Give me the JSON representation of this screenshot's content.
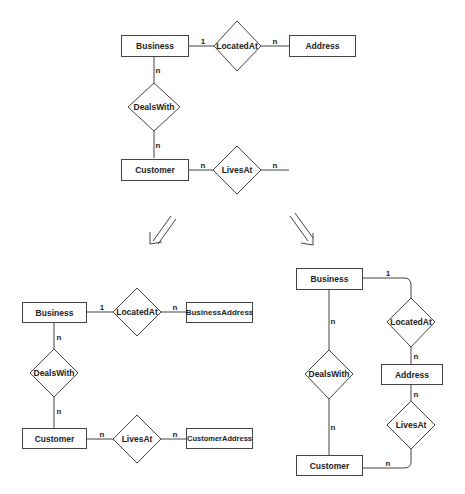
{
  "colors": {
    "stroke": "#444444",
    "text": "#222222",
    "background": "#ffffff"
  },
  "original": {
    "entities": {
      "business": "Business",
      "address": "Address",
      "customer": "Customer"
    },
    "relationships": {
      "located_at": "LocatedAt",
      "deals_with": "DealsWith",
      "lives_at": "LivesAt"
    },
    "cardinalities": {
      "business_locatedat": "1",
      "locatedat_address": "n",
      "business_dealswith": "n",
      "dealswith_customer": "n",
      "customer_livesat": "n",
      "livesat_address": "n"
    }
  },
  "arrows": {
    "left": "double-arrow-down-left-icon",
    "right": "double-arrow-down-right-icon"
  },
  "option_a": {
    "entities": {
      "business": "Business",
      "business_address": "BusinessAddress",
      "customer": "Customer",
      "customer_address": "CustomerAddress"
    },
    "relationships": {
      "located_at": "LocatedAt",
      "deals_with": "DealsWith",
      "lives_at": "LivesAt"
    },
    "cardinalities": {
      "business_locatedat": "1",
      "locatedat_address": "n",
      "business_dealswith": "n",
      "dealswith_customer": "n",
      "customer_livesat": "n",
      "livesat_address": "n"
    }
  },
  "option_b": {
    "entities": {
      "business": "Business",
      "address": "Address",
      "customer": "Customer"
    },
    "relationships": {
      "located_at": "LocatedAt",
      "deals_with": "DealsWith",
      "lives_at": "LivesAt"
    },
    "cardinalities": {
      "business_locatedat": "1",
      "locatedat_address": "n",
      "business_dealswith": "n",
      "address_livesat": "n",
      "livesat_customer": "n"
    }
  }
}
